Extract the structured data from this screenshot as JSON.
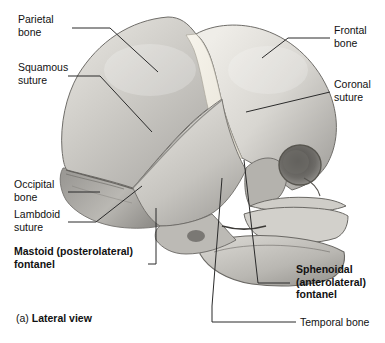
{
  "figure": {
    "caption_marker": "(a)",
    "caption_title": "Lateral view"
  },
  "labels": {
    "parietal_bone": "Parietal\nbone",
    "squamous_suture": "Squamous\nsuture",
    "occipital_bone": "Occipital\nbone",
    "lambdoid_suture": "Lambdoid\nsuture",
    "mastoid_fontanel": "Mastoid (posterolateral)\nfontanel",
    "frontal_bone": "Frontal\nbone",
    "coronal_suture": "Coronal\nsuture",
    "sphenoidal_fontanel": "Sphenoidal\n(anterolateral)\nfontanel",
    "temporal_bone": "Temporal bone"
  },
  "colors": {
    "background": "#ffffff",
    "text": "#111111",
    "leader_line": "#2b2b2b",
    "bone_light": "#e9e7e2",
    "bone_mid": "#c9c7c2",
    "bone_shade": "#a7a5a1",
    "bone_dark": "#8d8b87",
    "suture_cream": "#f2efe6",
    "outline": "#6f6d69",
    "orbit_dark": "#595754"
  }
}
